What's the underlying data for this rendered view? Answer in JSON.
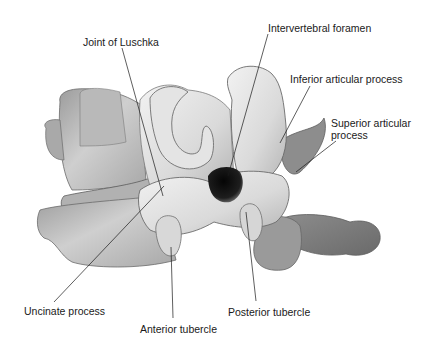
{
  "figure": {
    "background": "#ffffff",
    "bone_colors": {
      "light": "#e6e6e6",
      "mid": "#bdbdbd",
      "dark": "#8a8a8a",
      "foramen": "#141414",
      "outline": "#6e6e6e"
    }
  },
  "labels": [
    {
      "id": "joint-of-luschka",
      "text": "Joint of Luschka",
      "x": 83,
      "y": 36,
      "line": [
        122,
        48,
        163,
        196
      ]
    },
    {
      "id": "intervertebral-foramen",
      "text": "Intervertebral foramen",
      "x": 268,
      "y": 22,
      "line": [
        268,
        34,
        228,
        176
      ]
    },
    {
      "id": "inferior-articular-process",
      "text": "Inferior articular process",
      "x": 290,
      "y": 73,
      "line": [
        310,
        86,
        280,
        143
      ]
    },
    {
      "id": "superior-articular-process",
      "text": "Superior articular\nprocess",
      "x": 331,
      "y": 117,
      "line": [
        336,
        141,
        296,
        172
      ]
    },
    {
      "id": "uncinate-process",
      "text": "Uncinate process",
      "x": 24,
      "y": 305,
      "line": [
        54,
        302,
        164,
        186
      ]
    },
    {
      "id": "anterior-tubercle",
      "text": "Anterior tubercle",
      "x": 140,
      "y": 323,
      "line": [
        173,
        318,
        171,
        247
      ]
    },
    {
      "id": "posterior-tubercle",
      "text": "Posterior tubercle",
      "x": 228,
      "y": 306,
      "line": [
        256,
        301,
        246,
        212
      ]
    }
  ]
}
